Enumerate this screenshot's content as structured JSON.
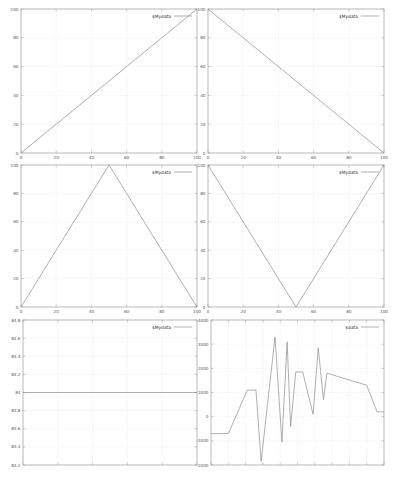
{
  "layout": {
    "rows": 3,
    "cols": 2
  },
  "colors": {
    "frame": "#9a9a9a",
    "grid": "#e4e4e4",
    "line": "#8c8c8c",
    "text": "#555555",
    "background": "#ffffff"
  },
  "chart_data": [
    {
      "id": "top-left",
      "type": "line",
      "title": "",
      "legend": "$Mydata",
      "legend_position": "top-right",
      "x": [
        0,
        100
      ],
      "y": [
        0,
        100
      ],
      "xlim": [
        0,
        100
      ],
      "ylim": [
        0,
        100
      ],
      "xticks": [
        "0",
        "20",
        "40",
        "60",
        "80",
        "100"
      ],
      "yticks": [
        "0",
        "20",
        "40",
        "60",
        "80",
        "100"
      ],
      "grid": true,
      "xlabel": "",
      "ylabel": ""
    },
    {
      "id": "top-right",
      "type": "line",
      "title": "",
      "legend": "$Mydata",
      "legend_position": "top-right",
      "x": [
        0,
        100
      ],
      "y": [
        100,
        0
      ],
      "xlim": [
        0,
        100
      ],
      "ylim": [
        0,
        100
      ],
      "xticks": [
        "0",
        "20",
        "40",
        "60",
        "80",
        "100"
      ],
      "yticks": [
        "0",
        "20",
        "40",
        "60",
        "80",
        "100"
      ],
      "grid": true,
      "xlabel": "",
      "ylabel": ""
    },
    {
      "id": "middle-left",
      "type": "line",
      "title": "",
      "legend": "$Mydata",
      "legend_position": "top-right",
      "x": [
        0,
        50,
        100
      ],
      "y": [
        0,
        100,
        0
      ],
      "xlim": [
        0,
        100
      ],
      "ylim": [
        0,
        100
      ],
      "xticks": [
        "0",
        "20",
        "40",
        "60",
        "80",
        "100"
      ],
      "yticks": [
        "0",
        "20",
        "40",
        "60",
        "80",
        "100"
      ],
      "grid": true,
      "xlabel": "",
      "ylabel": ""
    },
    {
      "id": "middle-right",
      "type": "line",
      "title": "",
      "legend": "$Mydata",
      "legend_position": "top-right",
      "x": [
        0,
        50,
        100
      ],
      "y": [
        100,
        0,
        100
      ],
      "xlim": [
        0,
        100
      ],
      "ylim": [
        0,
        100
      ],
      "xticks": [
        "0",
        "20",
        "40",
        "60",
        "80",
        "100"
      ],
      "yticks": [
        "0",
        "20",
        "40",
        "60",
        "80",
        "100"
      ],
      "grid": true,
      "xlabel": "",
      "ylabel": ""
    },
    {
      "id": "bottom-left",
      "type": "line",
      "title": "",
      "legend": "$Mydata",
      "legend_position": "top-right",
      "x": [
        0,
        100
      ],
      "y": [
        84,
        84
      ],
      "xlim": [
        0,
        100
      ],
      "ylim": [
        83.2,
        84.8
      ],
      "xticks": [
        "0",
        "20",
        "40",
        "60",
        "80",
        "100"
      ],
      "xticks_visible_labels": false,
      "yticks": [
        "83.2",
        "83.4",
        "83.6",
        "83.8",
        "84",
        "84.2",
        "84.4",
        "84.6",
        "84.8"
      ],
      "grid": true,
      "xlabel": "",
      "ylabel": ""
    },
    {
      "id": "bottom-right",
      "type": "line",
      "title": "",
      "legend": "$data",
      "legend_position": "top-right",
      "x": [
        0,
        10,
        21,
        26,
        29,
        37,
        41,
        44,
        46,
        49,
        53,
        59,
        62,
        65,
        67,
        90,
        96,
        100
      ],
      "y": [
        -700,
        -700,
        1100,
        1100,
        -1850,
        3300,
        -1050,
        3100,
        -400,
        1850,
        1850,
        100,
        2850,
        700,
        1800,
        1300,
        200,
        200
      ],
      "xlim": [
        0,
        100
      ],
      "ylim": [
        -2000,
        4000
      ],
      "xticks": [
        "",
        "",
        "",
        "",
        "",
        "",
        "",
        "",
        "",
        "",
        ""
      ],
      "yticks": [
        "-2000",
        "-1000",
        "0",
        "1000",
        "2000",
        "3000",
        "4000"
      ],
      "grid": true,
      "xlabel": "",
      "ylabel": ""
    }
  ]
}
